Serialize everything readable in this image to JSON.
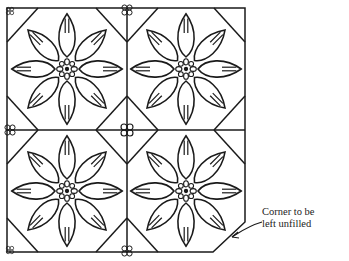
{
  "diagram": {
    "type": "quilt-block-pattern",
    "tiles": [
      {
        "id": "top-left",
        "motif": "eight-petal flower"
      },
      {
        "id": "top-right",
        "motif": "eight-petal flower"
      },
      {
        "id": "bottom-left",
        "motif": "eight-petal flower"
      },
      {
        "id": "bottom-right",
        "motif": "eight-petal flower",
        "corner_unfilled": true
      }
    ],
    "annotation": {
      "line1": "Corner to be",
      "line2": "left unfilled"
    },
    "stroke_color": "#1a1a1a"
  }
}
